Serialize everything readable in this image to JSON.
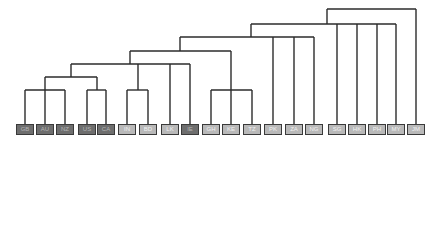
{
  "diagram": {
    "type": "dendrogram",
    "line_color": "#2b2b2b",
    "colors": {
      "dark": "#6e6e6e",
      "light": "#b9b9b9",
      "border": "#3a3a3a"
    },
    "leaves": [
      {
        "label": "GB",
        "x": 25,
        "shade": "dark"
      },
      {
        "label": "AU",
        "x": 45,
        "shade": "dark"
      },
      {
        "label": "NZ",
        "x": 65,
        "shade": "dark"
      },
      {
        "label": "US",
        "x": 87,
        "shade": "dark"
      },
      {
        "label": "CA",
        "x": 106,
        "shade": "dark"
      },
      {
        "label": "IN",
        "x": 127,
        "shade": "light"
      },
      {
        "label": "BD",
        "x": 148,
        "shade": "light"
      },
      {
        "label": "LK",
        "x": 170,
        "shade": "light"
      },
      {
        "label": "IE",
        "x": 190,
        "shade": "dark"
      },
      {
        "label": "GH",
        "x": 211,
        "shade": "light"
      },
      {
        "label": "KE",
        "x": 231,
        "shade": "light"
      },
      {
        "label": "TZ",
        "x": 252,
        "shade": "light"
      },
      {
        "label": "PK",
        "x": 273,
        "shade": "light"
      },
      {
        "label": "ZA",
        "x": 294,
        "shade": "light"
      },
      {
        "label": "NG",
        "x": 314,
        "shade": "light"
      },
      {
        "label": "SG",
        "x": 337,
        "shade": "light"
      },
      {
        "label": "HK",
        "x": 357,
        "shade": "light"
      },
      {
        "label": "PH",
        "x": 377,
        "shade": "light"
      },
      {
        "label": "MY",
        "x": 396,
        "shade": "light"
      },
      {
        "label": "JM",
        "x": 416,
        "shade": "light"
      }
    ],
    "clusters": [
      {
        "name": "gb-au-nz",
        "y": 90,
        "children_x": [
          25,
          45,
          65
        ],
        "stem_x": 45
      },
      {
        "name": "us-ca",
        "y": 90,
        "children_x": [
          87,
          106
        ],
        "stem_x": 97
      },
      {
        "name": "in-bd",
        "y": 90,
        "children_x": [
          127,
          148
        ],
        "stem_x": 138
      },
      {
        "name": "gh-ke-tz",
        "y": 90,
        "children_x": [
          211,
          231,
          252
        ],
        "stem_x": 231
      },
      {
        "name": "anglo",
        "y": 77,
        "children_x": [
          45,
          97
        ],
        "stem_x": 71
      },
      {
        "name": "anglo-southasia",
        "y": 64,
        "children_x": [
          71,
          138,
          170,
          190
        ],
        "stem_x": 130
      },
      {
        "name": "plus-africa",
        "y": 51,
        "children_x": [
          130,
          231
        ],
        "stem_x": 180
      },
      {
        "name": "plus-pk-za-ng",
        "y": 37,
        "children_x": [
          180,
          273,
          294,
          314
        ],
        "stem_x": 251
      },
      {
        "name": "plus-asia",
        "y": 24,
        "children_x": [
          251,
          337,
          357,
          377,
          396
        ],
        "stem_x": 327
      },
      {
        "name": "root",
        "y": 9,
        "children_x": [
          327,
          416
        ],
        "stem_x": null
      }
    ],
    "leaf_top_y": 124
  }
}
